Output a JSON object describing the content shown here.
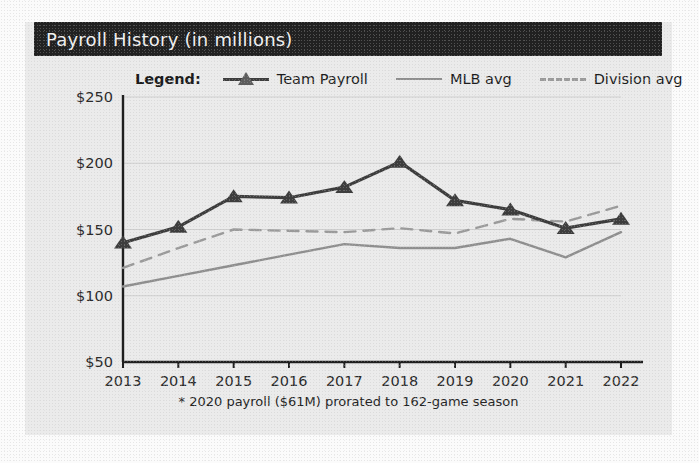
{
  "card": {
    "title": "Payroll History (in millions)",
    "background": "#ebebeb",
    "header_background": "#212121",
    "header_text_color": "#f2f2f2"
  },
  "legend": {
    "title": "Legend:",
    "entries": [
      {
        "label": "Team Payroll",
        "style": "solid-marker",
        "color": "#3d3d3d",
        "marker": "triangle-up-icon"
      },
      {
        "label": "MLB avg",
        "style": "solid",
        "color": "#8e8e8e",
        "marker": "none"
      },
      {
        "label": "Division avg",
        "style": "dashed",
        "color": "#9a9a9a",
        "marker": "none"
      }
    ]
  },
  "footnote": "* 2020 payroll ($61M) prorated to 162-game season",
  "chart_data": {
    "type": "line",
    "title": "Payroll History (in millions)",
    "xlabel": "",
    "ylabel": "",
    "x": [
      2013,
      2014,
      2015,
      2016,
      2017,
      2018,
      2019,
      2020,
      2021,
      2022
    ],
    "categories": [
      "2013",
      "2014",
      "2015",
      "2016",
      "2017",
      "2018",
      "2019",
      "2020",
      "2021",
      "2022"
    ],
    "ylim": [
      50,
      250
    ],
    "yticks": [
      50,
      100,
      150,
      200,
      250
    ],
    "ytick_labels": [
      "$50",
      "$100",
      "$150",
      "$200",
      "$250"
    ],
    "xtick_labels": [
      "2013",
      "2014",
      "2015",
      "2016",
      "2017",
      "2018",
      "2019",
      "2020",
      "2021",
      "2022"
    ],
    "grid": true,
    "legend_position": "above-top-center",
    "series": [
      {
        "name": "Team Payroll",
        "color": "#3d3d3d",
        "style": "solid",
        "marker": "triangle",
        "values": [
          140,
          152,
          175,
          174,
          182,
          201,
          172,
          165,
          151,
          158
        ]
      },
      {
        "name": "MLB avg",
        "color": "#8e8e8e",
        "style": "solid",
        "marker": "none",
        "values": [
          107,
          115,
          123,
          131,
          139,
          136,
          136,
          143,
          129,
          148
        ]
      },
      {
        "name": "Division avg",
        "color": "#9a9a9a",
        "style": "dashed",
        "marker": "none",
        "values": [
          121,
          136,
          150,
          149,
          148,
          151,
          147,
          158,
          156,
          168
        ]
      }
    ]
  }
}
